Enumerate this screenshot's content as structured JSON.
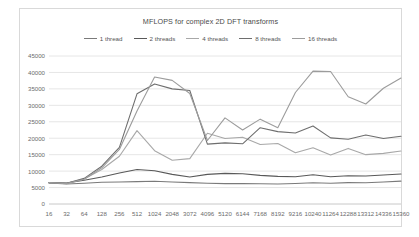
{
  "chart_data": {
    "type": "line",
    "title": "MFLOPS for complex 2D DFT transforms",
    "xlabel": "",
    "ylabel": "",
    "ylim": [
      0,
      45000
    ],
    "ytick_step": 5000,
    "yticks": [
      "0",
      "5000",
      "10000",
      "15000",
      "20000",
      "25000",
      "30000",
      "35000",
      "40000",
      "45000"
    ],
    "grid": true,
    "legend_position": "top",
    "categories": [
      "16",
      "32",
      "64",
      "128",
      "256",
      "512",
      "1024",
      "2048",
      "3072",
      "4096",
      "5120",
      "6144",
      "7168",
      "8192",
      "9216",
      "10240",
      "11264",
      "12288",
      "13312",
      "14336",
      "15360"
    ],
    "series": [
      {
        "name": "1 thread",
        "color": "#7a7a7a",
        "values": [
          6400,
          6100,
          6300,
          6600,
          6700,
          6800,
          6900,
          6700,
          6500,
          6300,
          6200,
          6200,
          6150,
          6100,
          6250,
          6450,
          6300,
          6500,
          6450,
          6700,
          6950
        ]
      },
      {
        "name": "2 threads",
        "color": "#595959",
        "values": [
          6500,
          6400,
          7200,
          8200,
          9400,
          10500,
          10100,
          9000,
          8200,
          9000,
          9300,
          9200,
          8700,
          8400,
          8300,
          8900,
          8300,
          8600,
          8500,
          8800,
          9100
        ]
      },
      {
        "name": "4 threads",
        "color": "#a8a8a8",
        "values": [
          6500,
          6300,
          7600,
          10500,
          14500,
          22300,
          16200,
          13300,
          13800,
          21500,
          19900,
          20300,
          18100,
          18400,
          15600,
          17100,
          14900,
          16900,
          15000,
          15400,
          16100
        ]
      },
      {
        "name": "8 threads",
        "color": "#6e6e6e",
        "values": [
          6500,
          6300,
          7800,
          11500,
          17200,
          33500,
          36500,
          35000,
          34500,
          18200,
          18600,
          18300,
          23200,
          22000,
          21600,
          23700,
          20100,
          19700,
          21000,
          19900,
          20600
        ]
      },
      {
        "name": "16 threads",
        "color": "#9c9c9c",
        "values": [
          6500,
          6200,
          7500,
          11000,
          16600,
          28300,
          38600,
          37600,
          33600,
          19300,
          26200,
          22500,
          25800,
          23200,
          33900,
          40400,
          40300,
          32600,
          30400,
          35200,
          38300
        ]
      }
    ]
  }
}
